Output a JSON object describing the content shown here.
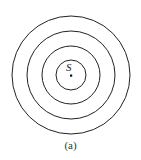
{
  "diagram": {
    "center": {
      "x": 71,
      "y": 75
    },
    "source_label": "S",
    "caption": "(a)",
    "rings": [
      {
        "r": 15
      },
      {
        "r": 29
      },
      {
        "r": 44
      },
      {
        "r": 59
      }
    ],
    "stroke_color": "#222222"
  }
}
